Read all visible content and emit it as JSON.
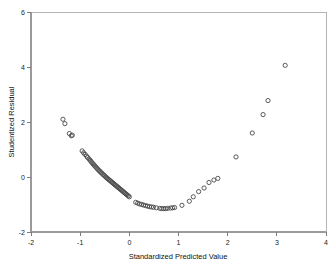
{
  "chart_data": {
    "type": "scatter",
    "title": "",
    "xlabel": "Standardized Predicted Value",
    "ylabel": "Studentized Residual",
    "xlim": [
      -2,
      4
    ],
    "ylim": [
      -2,
      6
    ],
    "xticks": [
      -2,
      -1,
      0,
      1,
      2,
      3,
      4
    ],
    "xticklabels": [
      "-2",
      "-1",
      "0",
      "1",
      "2",
      "3",
      "4"
    ],
    "yticks": [
      -2,
      0,
      2,
      4,
      6
    ],
    "yticklabels": [
      "-2",
      "0",
      "2",
      "4",
      "6"
    ],
    "grid": false,
    "legend": null,
    "marker": {
      "shape": "open-circle",
      "radius": 2.1,
      "edge_color": "#4a4a4a",
      "fill_color": "none"
    },
    "series": [
      {
        "name": "Residuals",
        "x": [
          -1.35,
          -1.31,
          -1.22,
          -1.18,
          -1.16,
          -0.96,
          -0.93,
          -0.9,
          -0.87,
          -0.85,
          -0.82,
          -0.8,
          -0.78,
          -0.76,
          -0.74,
          -0.72,
          -0.7,
          -0.68,
          -0.66,
          -0.64,
          -0.62,
          -0.6,
          -0.58,
          -0.56,
          -0.54,
          -0.52,
          -0.5,
          -0.48,
          -0.46,
          -0.44,
          -0.42,
          -0.4,
          -0.38,
          -0.36,
          -0.34,
          -0.32,
          -0.3,
          -0.28,
          -0.26,
          -0.24,
          -0.22,
          -0.2,
          -0.18,
          -0.16,
          -0.14,
          -0.12,
          -0.1,
          -0.08,
          -0.06,
          -0.04,
          -0.02,
          0.0,
          0.13,
          0.17,
          0.21,
          0.25,
          0.29,
          0.33,
          0.37,
          0.41,
          0.45,
          0.49,
          0.55,
          0.62,
          0.66,
          0.7,
          0.74,
          0.78,
          0.84,
          0.88,
          0.92,
          1.07,
          1.22,
          1.3,
          1.41,
          1.52,
          1.62,
          1.72,
          1.8,
          2.17,
          2.5,
          2.72,
          2.82,
          3.17
        ],
        "y": [
          2.1,
          1.94,
          1.58,
          1.5,
          1.52,
          0.95,
          0.88,
          0.82,
          0.76,
          0.71,
          0.66,
          0.61,
          0.57,
          0.52,
          0.48,
          0.44,
          0.4,
          0.36,
          0.32,
          0.28,
          0.24,
          0.21,
          0.17,
          0.14,
          0.1,
          0.07,
          0.04,
          0.0,
          -0.03,
          -0.06,
          -0.09,
          -0.12,
          -0.15,
          -0.18,
          -0.21,
          -0.24,
          -0.27,
          -0.3,
          -0.33,
          -0.36,
          -0.39,
          -0.42,
          -0.45,
          -0.48,
          -0.51,
          -0.54,
          -0.57,
          -0.6,
          -0.63,
          -0.66,
          -0.69,
          -0.72,
          -0.92,
          -0.95,
          -0.98,
          -1.0,
          -1.02,
          -1.04,
          -1.06,
          -1.08,
          -1.09,
          -1.1,
          -1.12,
          -1.14,
          -1.15,
          -1.15,
          -1.15,
          -1.14,
          -1.13,
          -1.12,
          -1.11,
          -1.03,
          -0.88,
          -0.72,
          -0.53,
          -0.4,
          -0.2,
          -0.11,
          -0.05,
          0.73,
          1.6,
          2.27,
          2.78,
          4.06
        ]
      }
    ]
  },
  "axes": {
    "x_title": "Standardized Predicted Value",
    "y_title": "Studentized Residual"
  }
}
